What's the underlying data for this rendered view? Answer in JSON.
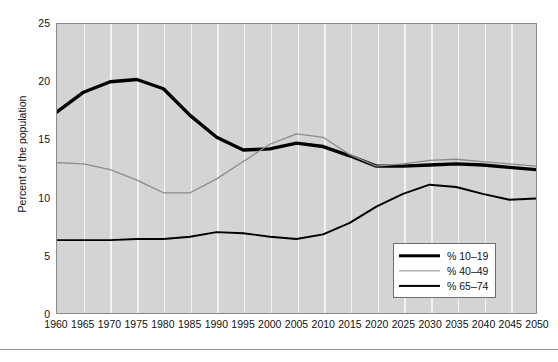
{
  "chart_data": {
    "type": "line",
    "title": "",
    "subtitle": "",
    "xlabel": "",
    "ylabel": "Percent of the population",
    "xlim": [
      1960,
      2050
    ],
    "ylim": [
      0,
      25
    ],
    "yticks": [
      0,
      5,
      10,
      15,
      20,
      25
    ],
    "ytick_labels": [
      "0",
      "5",
      "10",
      "15",
      "20",
      "25"
    ],
    "grid": "vertical-only",
    "legend_position": "bottom-right",
    "categories": [
      1960,
      1965,
      1970,
      1975,
      1980,
      1985,
      1990,
      1995,
      2000,
      2005,
      2010,
      2015,
      2020,
      2025,
      2030,
      2035,
      2040,
      2045,
      2050
    ],
    "xtick_labels": [
      "1960",
      "1965",
      "1970",
      "1975",
      "1980",
      "1985",
      "1990",
      "1995",
      "2000",
      "2005",
      "2010",
      "2015",
      "2020",
      "2025",
      "2030",
      "2035",
      "2040",
      "2045",
      "2050"
    ],
    "series": [
      {
        "name": "% 10–19",
        "color": "#000000",
        "width": 3.4,
        "values": [
          17.4,
          19.1,
          20.0,
          20.2,
          19.4,
          17.1,
          15.2,
          14.1,
          14.2,
          14.7,
          14.4,
          13.6,
          12.7,
          12.7,
          12.8,
          12.9,
          12.8,
          12.6,
          12.4
        ]
      },
      {
        "name": "% 40–49",
        "color": "#8c8c8c",
        "width": 1.3,
        "values": [
          13.0,
          12.9,
          12.4,
          11.5,
          10.4,
          10.4,
          11.6,
          13.1,
          14.6,
          15.5,
          15.2,
          13.7,
          12.7,
          12.9,
          13.2,
          13.3,
          13.1,
          12.9,
          12.7
        ]
      },
      {
        "name": "% 65–74",
        "color": "#000000",
        "width": 1.9,
        "values": [
          6.3,
          6.3,
          6.3,
          6.4,
          6.4,
          6.6,
          7.0,
          6.9,
          6.6,
          6.4,
          6.8,
          7.8,
          9.2,
          10.3,
          11.1,
          10.9,
          10.3,
          9.8,
          9.9
        ]
      }
    ]
  },
  "legend": {
    "items": [
      {
        "label": "% 10–19"
      },
      {
        "label": "% 40–49"
      },
      {
        "label": "% 65–74"
      }
    ]
  }
}
